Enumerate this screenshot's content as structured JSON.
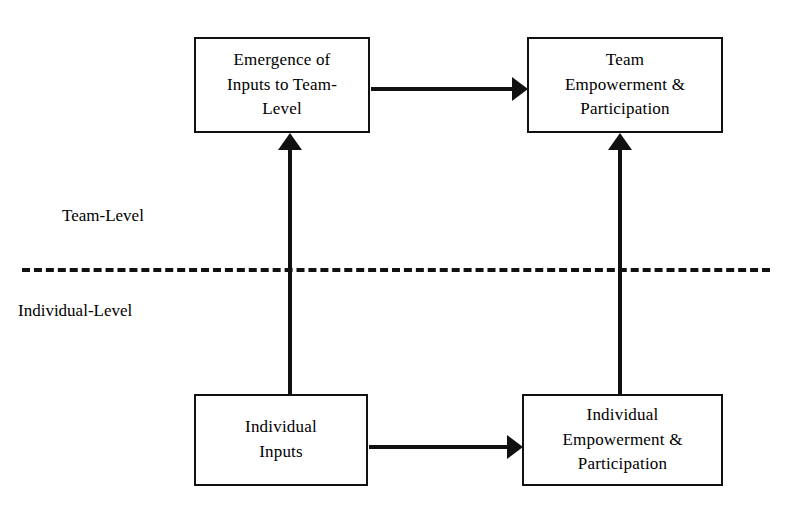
{
  "diagram": {
    "canvas": {
      "width": 787,
      "height": 516,
      "background": "#ffffff"
    },
    "line_color": "#111111",
    "boxes": [
      {
        "id": "emergence-inputs",
        "label": "Emergence of\nInputs to Team-\nLevel",
        "level": "Team-Level",
        "position": {
          "x": 194,
          "y": 37,
          "width": 176,
          "height": 96
        }
      },
      {
        "id": "team-empowerment",
        "label": "Team\nEmpowerment &\nParticipation",
        "level": "Team-Level",
        "position": {
          "x": 527,
          "y": 37,
          "width": 196,
          "height": 96
        }
      },
      {
        "id": "individual-inputs",
        "label": "Individual\nInputs",
        "level": "Individual-Level",
        "position": {
          "x": 194,
          "y": 394,
          "width": 174,
          "height": 92
        }
      },
      {
        "id": "individual-empowerment",
        "label": "Individual\nEmpowerment &\nParticipation",
        "level": "Individual-Level",
        "position": {
          "x": 522,
          "y": 394,
          "width": 201,
          "height": 92
        }
      }
    ],
    "level_captions": [
      {
        "id": "team-level",
        "label": "Team-Level"
      },
      {
        "id": "individual-level",
        "label": "Individual-Level"
      }
    ],
    "divider": {
      "id": "level-divider",
      "style": "dashed",
      "orientation": "horizontal",
      "y": 268,
      "x_start": 22,
      "x_end": 770
    },
    "arrows": [
      {
        "id": "emergence-to-team-empowerment",
        "from": "emergence-inputs",
        "to": "team-empowerment",
        "direction": "right"
      },
      {
        "id": "individual-inputs-to-individual-empowerment",
        "from": "individual-inputs",
        "to": "individual-empowerment",
        "direction": "right"
      },
      {
        "id": "individual-inputs-to-emergence",
        "from": "individual-inputs",
        "to": "emergence-inputs",
        "direction": "up"
      },
      {
        "id": "individual-empowerment-to-team-empowerment",
        "from": "individual-empowerment",
        "to": "team-empowerment",
        "direction": "up"
      }
    ]
  }
}
